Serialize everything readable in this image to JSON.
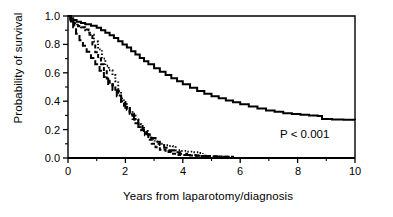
{
  "chart_data": {
    "type": "line",
    "title": "",
    "subtitle": "",
    "xlabel": "Years from laparotomy/diagnosis",
    "ylabel": "Probability of survival",
    "xlim": [
      0,
      10
    ],
    "ylim": [
      0,
      1.0
    ],
    "x_ticks": [
      "0",
      "2",
      "4",
      "6",
      "8",
      "10"
    ],
    "x_tick_values": [
      0,
      2,
      4,
      6,
      8,
      10
    ],
    "y_ticks": [
      "0.0",
      "0.2",
      "0.4",
      "0.6",
      "0.8",
      "1.0"
    ],
    "y_tick_values": [
      0.0,
      0.2,
      0.4,
      0.6,
      0.8,
      1.0
    ],
    "x_minor_ticks": [
      1,
      3,
      5,
      7,
      9
    ],
    "y_minor_ticks": [
      0.1,
      0.3,
      0.5,
      0.7,
      0.9
    ],
    "grid": false,
    "legend_position": "none",
    "annotations": [
      {
        "text": "P < 0.001",
        "x": 7.6,
        "y": 0.2
      }
    ],
    "colors": {
      "axis": "#000000",
      "curve": "#000000",
      "background": "#ffffff"
    },
    "series": [
      {
        "name": "solid-curve",
        "style": "solid",
        "points": [
          [
            0.0,
            1.0
          ],
          [
            0.08,
            0.985
          ],
          [
            0.18,
            0.972
          ],
          [
            0.3,
            0.96
          ],
          [
            0.45,
            0.95
          ],
          [
            0.6,
            0.942
          ],
          [
            0.8,
            0.932
          ],
          [
            1.0,
            0.918
          ],
          [
            1.15,
            0.9
          ],
          [
            1.3,
            0.882
          ],
          [
            1.45,
            0.865
          ],
          [
            1.6,
            0.845
          ],
          [
            1.75,
            0.822
          ],
          [
            1.9,
            0.8
          ],
          [
            2.05,
            0.778
          ],
          [
            2.2,
            0.752
          ],
          [
            2.35,
            0.728
          ],
          [
            2.5,
            0.705
          ],
          [
            2.65,
            0.682
          ],
          [
            2.8,
            0.66
          ],
          [
            3.0,
            0.632
          ],
          [
            3.2,
            0.608
          ],
          [
            3.4,
            0.585
          ],
          [
            3.6,
            0.562
          ],
          [
            3.8,
            0.54
          ],
          [
            4.0,
            0.52
          ],
          [
            4.25,
            0.495
          ],
          [
            4.5,
            0.472
          ],
          [
            4.75,
            0.452
          ],
          [
            5.0,
            0.435
          ],
          [
            5.25,
            0.42
          ],
          [
            5.5,
            0.405
          ],
          [
            5.75,
            0.392
          ],
          [
            6.0,
            0.378
          ],
          [
            6.3,
            0.362
          ],
          [
            6.6,
            0.348
          ],
          [
            6.9,
            0.335
          ],
          [
            7.2,
            0.325
          ],
          [
            7.5,
            0.316
          ],
          [
            7.8,
            0.31
          ],
          [
            8.1,
            0.305
          ],
          [
            8.4,
            0.3
          ],
          [
            8.7,
            0.296
          ],
          [
            8.85,
            0.275
          ],
          [
            9.2,
            0.272
          ],
          [
            9.6,
            0.27
          ],
          [
            10.0,
            0.268
          ]
        ]
      },
      {
        "name": "dotted-curve",
        "style": "dotted",
        "points": [
          [
            0.0,
            1.0
          ],
          [
            0.1,
            0.975
          ],
          [
            0.2,
            0.95
          ],
          [
            0.32,
            0.93
          ],
          [
            0.45,
            0.92
          ],
          [
            0.6,
            0.9
          ],
          [
            0.75,
            0.868
          ],
          [
            0.9,
            0.82
          ],
          [
            1.05,
            0.765
          ],
          [
            1.18,
            0.7
          ],
          [
            1.3,
            0.65
          ],
          [
            1.42,
            0.618
          ],
          [
            1.55,
            0.585
          ],
          [
            1.65,
            0.54
          ],
          [
            1.75,
            0.47
          ],
          [
            1.85,
            0.42
          ],
          [
            1.95,
            0.39
          ],
          [
            2.05,
            0.36
          ],
          [
            2.15,
            0.33
          ],
          [
            2.25,
            0.3
          ],
          [
            2.35,
            0.268
          ],
          [
            2.45,
            0.238
          ],
          [
            2.55,
            0.212
          ],
          [
            2.65,
            0.19
          ],
          [
            2.78,
            0.16
          ],
          [
            2.9,
            0.135
          ],
          [
            3.02,
            0.115
          ],
          [
            3.15,
            0.1
          ],
          [
            3.3,
            0.09
          ],
          [
            3.5,
            0.085
          ],
          [
            3.65,
            0.082
          ],
          [
            3.75,
            0.055
          ],
          [
            3.95,
            0.05
          ],
          [
            4.15,
            0.045
          ],
          [
            4.35,
            0.04
          ],
          [
            4.55,
            0.035
          ],
          [
            4.7,
            0.03
          ]
        ]
      },
      {
        "name": "dashed-curve",
        "style": "dashed",
        "points": [
          [
            0.0,
            1.0
          ],
          [
            0.1,
            0.962
          ],
          [
            0.22,
            0.935
          ],
          [
            0.35,
            0.928
          ],
          [
            0.5,
            0.92
          ],
          [
            0.62,
            0.905
          ],
          [
            0.75,
            0.86
          ],
          [
            0.85,
            0.8
          ],
          [
            0.95,
            0.745
          ],
          [
            1.05,
            0.7
          ],
          [
            1.15,
            0.66
          ],
          [
            1.25,
            0.62
          ],
          [
            1.35,
            0.56
          ],
          [
            1.45,
            0.53
          ],
          [
            1.55,
            0.51
          ],
          [
            1.65,
            0.48
          ],
          [
            1.75,
            0.44
          ],
          [
            1.85,
            0.4
          ],
          [
            1.95,
            0.368
          ],
          [
            2.05,
            0.34
          ],
          [
            2.15,
            0.308
          ],
          [
            2.25,
            0.275
          ],
          [
            2.35,
            0.245
          ],
          [
            2.45,
            0.218
          ],
          [
            2.55,
            0.195
          ],
          [
            2.68,
            0.16
          ],
          [
            2.8,
            0.128
          ],
          [
            2.92,
            0.1
          ],
          [
            3.05,
            0.075
          ],
          [
            3.2,
            0.058
          ],
          [
            3.4,
            0.042
          ],
          [
            3.6,
            0.03
          ],
          [
            3.85,
            0.022
          ],
          [
            4.2,
            0.018
          ],
          [
            4.6,
            0.014
          ],
          [
            5.0,
            0.01
          ],
          [
            5.4,
            0.008
          ],
          [
            5.75,
            0.006
          ]
        ]
      },
      {
        "name": "long-dash-curve",
        "style": "long-dash",
        "points": [
          [
            0.0,
            1.0
          ],
          [
            0.08,
            0.965
          ],
          [
            0.18,
            0.92
          ],
          [
            0.28,
            0.875
          ],
          [
            0.4,
            0.83
          ],
          [
            0.52,
            0.79
          ],
          [
            0.65,
            0.748
          ],
          [
            0.8,
            0.705
          ],
          [
            0.95,
            0.66
          ],
          [
            1.1,
            0.615
          ],
          [
            1.25,
            0.57
          ],
          [
            1.4,
            0.522
          ],
          [
            1.55,
            0.478
          ],
          [
            1.7,
            0.435
          ],
          [
            1.85,
            0.395
          ],
          [
            2.0,
            0.352
          ],
          [
            2.15,
            0.312
          ],
          [
            2.3,
            0.272
          ],
          [
            2.45,
            0.235
          ],
          [
            2.6,
            0.2
          ],
          [
            2.75,
            0.168
          ],
          [
            2.9,
            0.14
          ],
          [
            3.05,
            0.115
          ],
          [
            3.2,
            0.092
          ],
          [
            3.35,
            0.072
          ],
          [
            3.5,
            0.055
          ],
          [
            3.7,
            0.04
          ],
          [
            3.9,
            0.03
          ],
          [
            4.15,
            0.022
          ],
          [
            4.45,
            0.016
          ],
          [
            4.8,
            0.012
          ],
          [
            5.2,
            0.009
          ],
          [
            5.6,
            0.006
          ]
        ]
      }
    ]
  },
  "axes": {
    "x_title": "Years from laparotomy/diagnosis",
    "y_title": "Probability of survival",
    "x_tick_labels": [
      "0",
      "2",
      "4",
      "6",
      "8",
      "10"
    ],
    "y_tick_labels": [
      "1.0",
      "0.8",
      "0.6",
      "0.4",
      "0.2",
      "0.0"
    ]
  },
  "annotation": {
    "p_value": "P < 0.001"
  }
}
